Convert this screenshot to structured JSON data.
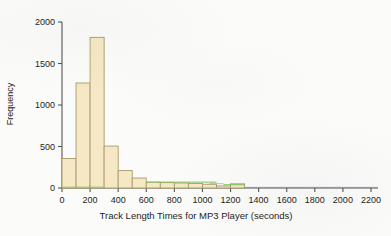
{
  "chart_data": {
    "type": "bar",
    "title": "",
    "subtitle": "",
    "xlabel": "Track Length Times for MP3 Player (seconds)",
    "ylabel": "Frequency",
    "xlim": [
      0,
      2250
    ],
    "ylim": [
      0,
      2100
    ],
    "xticks": [
      0,
      200,
      400,
      600,
      800,
      1000,
      1200,
      1400,
      1600,
      1800,
      2000,
      2200
    ],
    "xtick_labels": [
      "0",
      "200",
      "400",
      "600",
      "800",
      "1000",
      "1200",
      "1400",
      "1600",
      "1800",
      "2000",
      "2200"
    ],
    "yticks": [
      0,
      500,
      1000,
      1500,
      2000
    ],
    "ytick_labels": [
      "0",
      "500",
      "1000",
      "1500",
      "2000"
    ],
    "grid": false,
    "legend": null,
    "bin_width": 100,
    "bin_edges": [
      0,
      100,
      200,
      300,
      400,
      500,
      600,
      700,
      800,
      900,
      1000,
      1100,
      1200,
      1300
    ],
    "categories": [
      "0-100",
      "100-200",
      "200-300",
      "300-400",
      "400-500",
      "500-600",
      "600-700",
      "700-800",
      "800-900",
      "900-1000",
      "1000-1100",
      "1100-1200",
      "1200-1300"
    ],
    "values": [
      355,
      1265,
      1815,
      505,
      210,
      120,
      70,
      65,
      60,
      55,
      45,
      25,
      50
    ],
    "bar_fill_color": "#f6e8c4",
    "bar_edge_color": "#a99a6a",
    "axis_color": "#555555",
    "background_color": "#fbfbf9",
    "text_color": "#1d1d1d"
  },
  "figure": {
    "ylabel": "Frequency",
    "xlabel": "Track Length Times for MP3 Player (seconds)"
  }
}
